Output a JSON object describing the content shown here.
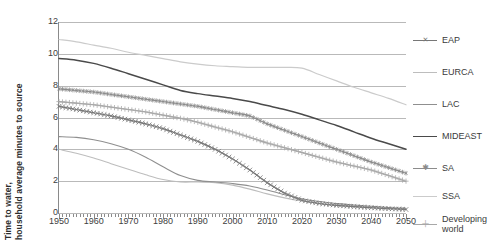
{
  "chart_data": {
    "type": "line",
    "title": "",
    "xlabel": "",
    "ylabel": "Time to water, household average minutes to source",
    "ylabel_line1": "Time to water,",
    "ylabel_line2": "household average minutes to source",
    "xlim": [
      1950,
      2050
    ],
    "ylim": [
      0,
      12
    ],
    "yticks": [
      0,
      2,
      4,
      6,
      8,
      10,
      12
    ],
    "xticks": [
      1950,
      1960,
      1970,
      1980,
      1990,
      2000,
      2010,
      2020,
      2030,
      2040,
      2050
    ],
    "xtick_labels": [
      "1950",
      "1960",
      "1970",
      "1980",
      "1990",
      "2000",
      "2010",
      "2020",
      "2030",
      "2040",
      "2050"
    ],
    "ytick_labels": [
      "0",
      "2",
      "4",
      "6",
      "8",
      "10",
      "12"
    ],
    "grid": "horizontal",
    "legend_position": "right",
    "x": [
      1950,
      1955,
      1960,
      1965,
      1970,
      1975,
      1980,
      1985,
      1990,
      1995,
      2000,
      2005,
      2010,
      2015,
      2020,
      2025,
      2030,
      2035,
      2040,
      2045,
      2050
    ],
    "series": [
      {
        "name": "EAP",
        "color": "#777777",
        "marker": "x",
        "width": 1.1,
        "values": [
          6.7,
          6.5,
          6.3,
          6.1,
          5.85,
          5.6,
          5.3,
          4.9,
          4.5,
          4.0,
          3.4,
          2.7,
          1.9,
          1.25,
          0.8,
          0.6,
          0.48,
          0.4,
          0.33,
          0.27,
          0.22
        ]
      },
      {
        "name": "EURCA",
        "color": "#bdbdbd",
        "marker": "none",
        "width": 1.1,
        "values": [
          4.0,
          3.75,
          3.45,
          3.1,
          2.75,
          2.4,
          2.1,
          1.95,
          1.95,
          1.9,
          1.75,
          1.5,
          1.2,
          0.95,
          0.75,
          0.6,
          0.5,
          0.42,
          0.35,
          0.3,
          0.25
        ]
      },
      {
        "name": "LAC",
        "color": "#8f8f8f",
        "marker": "none",
        "width": 1.1,
        "values": [
          4.8,
          4.75,
          4.6,
          4.35,
          4.0,
          3.5,
          2.9,
          2.35,
          2.05,
          1.95,
          1.85,
          1.7,
          1.45,
          1.15,
          0.9,
          0.72,
          0.6,
          0.5,
          0.42,
          0.35,
          0.3
        ]
      },
      {
        "name": "MIDEAST",
        "color": "#4a4a4a",
        "marker": "none",
        "width": 1.5,
        "values": [
          9.7,
          9.6,
          9.4,
          9.1,
          8.75,
          8.4,
          8.05,
          7.7,
          7.5,
          7.35,
          7.2,
          7.0,
          6.75,
          6.5,
          6.2,
          5.85,
          5.5,
          5.1,
          4.7,
          4.35,
          4.0
        ]
      },
      {
        "name": "SA",
        "color": "#8c8c8c",
        "marker": "asterisk",
        "width": 1.1,
        "values": [
          7.8,
          7.7,
          7.6,
          7.45,
          7.3,
          7.15,
          7.0,
          6.85,
          6.7,
          6.5,
          6.3,
          6.1,
          5.6,
          5.2,
          4.8,
          4.4,
          4.0,
          3.6,
          3.2,
          2.85,
          2.5
        ]
      },
      {
        "name": "SSA",
        "color": "#cbcbcb",
        "marker": "none",
        "width": 1.2,
        "values": [
          10.9,
          10.75,
          10.55,
          10.35,
          10.1,
          9.9,
          9.7,
          9.5,
          9.35,
          9.25,
          9.2,
          9.15,
          9.15,
          9.15,
          9.1,
          8.7,
          8.3,
          7.9,
          7.55,
          7.2,
          6.8
        ]
      },
      {
        "name": "Developing world",
        "color": "#a8a8a8",
        "marker": "plus",
        "width": 1.1,
        "values": [
          7.0,
          6.9,
          6.8,
          6.65,
          6.5,
          6.35,
          6.15,
          5.95,
          5.7,
          5.4,
          5.1,
          4.75,
          4.4,
          4.1,
          3.8,
          3.5,
          3.2,
          2.95,
          2.7,
          2.35,
          2.0
        ]
      }
    ]
  },
  "legend": {
    "items": [
      {
        "label": "EAP"
      },
      {
        "label": "EURCA"
      },
      {
        "label": "LAC"
      },
      {
        "label": "MIDEAST"
      },
      {
        "label": "SA"
      },
      {
        "label": "SSA"
      },
      {
        "label": "Developing world"
      }
    ]
  }
}
